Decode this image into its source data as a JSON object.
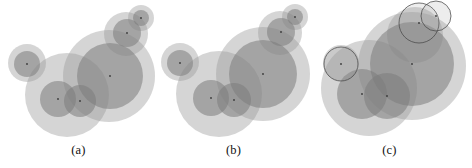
{
  "figure": {
    "background": "#ffffff",
    "width": 472,
    "height": 168,
    "panel_count": 3
  },
  "style": {
    "fill_light": "#9a9a9a",
    "fill_dark": "#7c7c7c",
    "outline_stroke": "#4a4a4a",
    "center_dot": "#3a3a3a",
    "fill_opacity_light": 0.42,
    "fill_opacity_dark": 0.55,
    "outline_width": 0.9
  },
  "panels": [
    {
      "id": "a",
      "caption": "(a)",
      "chart_data": {
        "type": "scatter",
        "title": "(a)",
        "xlabel": "",
        "ylabel": "",
        "xlim": [
          0,
          157
        ],
        "ylim": [
          0,
          140
        ],
        "grid": false,
        "legend": "none",
        "note": "overlapping translucent disks with centre dots",
        "circles": [
          {
            "cx": 109,
            "cy": 76,
            "r": 46,
            "tone": "light",
            "outline": false,
            "dot": false
          },
          {
            "cx": 67,
            "cy": 95,
            "r": 42,
            "tone": "light",
            "outline": false,
            "dot": false
          },
          {
            "cx": 126,
            "cy": 34,
            "r": 22,
            "tone": "light",
            "outline": false,
            "dot": false
          },
          {
            "cx": 141,
            "cy": 18,
            "r": 13,
            "tone": "light",
            "outline": false,
            "dot": false
          },
          {
            "cx": 27,
            "cy": 63,
            "r": 19,
            "tone": "light",
            "outline": false,
            "dot": false
          },
          {
            "cx": 110,
            "cy": 76,
            "r": 33,
            "tone": "dark",
            "outline": false,
            "dot": true
          },
          {
            "cx": 58,
            "cy": 99,
            "r": 18,
            "tone": "dark",
            "outline": false,
            "dot": true
          },
          {
            "cx": 80,
            "cy": 101,
            "r": 16,
            "tone": "dark",
            "outline": false,
            "dot": true
          },
          {
            "cx": 27,
            "cy": 64,
            "r": 13,
            "tone": "dark",
            "outline": false,
            "dot": true
          },
          {
            "cx": 127,
            "cy": 33,
            "r": 14,
            "tone": "dark",
            "outline": false,
            "dot": true
          },
          {
            "cx": 141,
            "cy": 18,
            "r": 8,
            "tone": "dark",
            "outline": false,
            "dot": true
          }
        ]
      }
    },
    {
      "id": "b",
      "caption": "(b)",
      "chart_data": {
        "type": "scatter",
        "title": "(b)",
        "xlabel": "",
        "ylabel": "",
        "xlim": [
          0,
          157
        ],
        "ylim": [
          0,
          140
        ],
        "grid": false,
        "legend": "none",
        "note": "same disk arrangement as (a), slightly shifted",
        "circles": [
          {
            "cx": 108,
            "cy": 74,
            "r": 47,
            "tone": "light",
            "outline": false,
            "dot": false
          },
          {
            "cx": 64,
            "cy": 94,
            "r": 43,
            "tone": "light",
            "outline": false,
            "dot": false
          },
          {
            "cx": 125,
            "cy": 33,
            "r": 22,
            "tone": "light",
            "outline": false,
            "dot": false
          },
          {
            "cx": 140,
            "cy": 17,
            "r": 13,
            "tone": "light",
            "outline": false,
            "dot": false
          },
          {
            "cx": 25,
            "cy": 62,
            "r": 19,
            "tone": "light",
            "outline": false,
            "dot": false
          },
          {
            "cx": 108,
            "cy": 74,
            "r": 34,
            "tone": "dark",
            "outline": false,
            "dot": true
          },
          {
            "cx": 56,
            "cy": 98,
            "r": 18,
            "tone": "dark",
            "outline": false,
            "dot": true
          },
          {
            "cx": 79,
            "cy": 100,
            "r": 17,
            "tone": "dark",
            "outline": false,
            "dot": true
          },
          {
            "cx": 25,
            "cy": 63,
            "r": 13,
            "tone": "dark",
            "outline": false,
            "dot": true
          },
          {
            "cx": 126,
            "cy": 32,
            "r": 14,
            "tone": "dark",
            "outline": false,
            "dot": true
          },
          {
            "cx": 140,
            "cy": 17,
            "r": 8,
            "tone": "dark",
            "outline": false,
            "dot": true
          }
        ]
      }
    },
    {
      "id": "c",
      "caption": "(c)",
      "chart_data": {
        "type": "scatter",
        "title": "(c)",
        "xlabel": "",
        "ylabel": "",
        "xlim": [
          0,
          157
        ],
        "ylim": [
          0,
          140
        ],
        "grid": false,
        "legend": "none",
        "note": "disks plus three thin-outlined highlighted circles",
        "circles": [
          {
            "cx": 101,
            "cy": 66,
            "r": 54,
            "tone": "light",
            "outline": false,
            "dot": false
          },
          {
            "cx": 58,
            "cy": 88,
            "r": 48,
            "tone": "light",
            "outline": false,
            "dot": false
          },
          {
            "cx": 104,
            "cy": 35,
            "r": 28,
            "tone": "light",
            "outline": false,
            "dot": false
          },
          {
            "cx": 30,
            "cy": 63,
            "r": 18,
            "tone": "light",
            "outline": false,
            "dot": false
          },
          {
            "cx": 101,
            "cy": 64,
            "r": 42,
            "tone": "dark",
            "outline": false,
            "dot": true
          },
          {
            "cx": 51,
            "cy": 94,
            "r": 25,
            "tone": "dark",
            "outline": false,
            "dot": true
          },
          {
            "cx": 76,
            "cy": 96,
            "r": 23,
            "tone": "dark",
            "outline": false,
            "dot": true
          },
          {
            "cx": 30,
            "cy": 64,
            "r": 17,
            "tone": "outlined",
            "outline": true,
            "dot": true
          },
          {
            "cx": 108,
            "cy": 23,
            "r": 20,
            "tone": "outlined",
            "outline": true,
            "dot": true
          },
          {
            "cx": 125,
            "cy": 16,
            "r": 15,
            "tone": "outlined",
            "outline": true,
            "dot": true
          }
        ]
      }
    }
  ]
}
